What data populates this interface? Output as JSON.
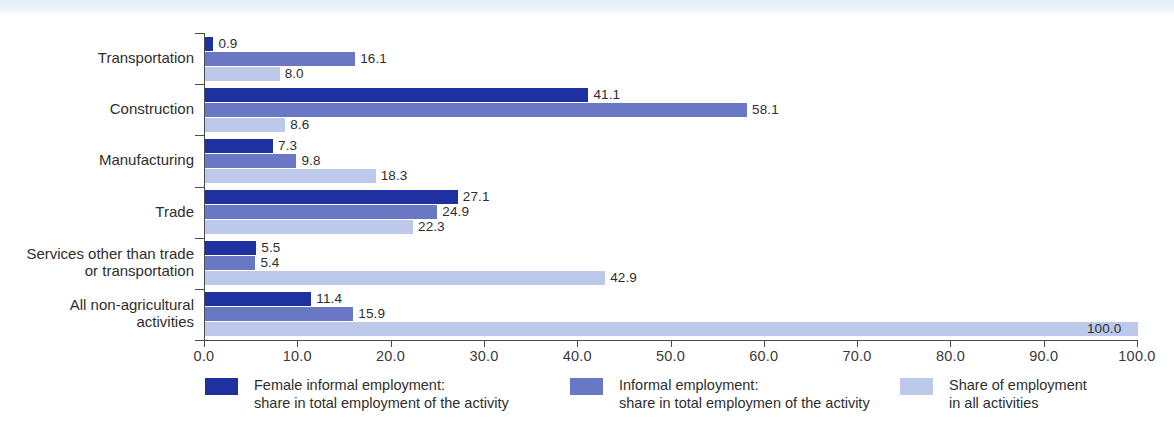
{
  "chart_data": {
    "type": "bar",
    "orientation": "horizontal",
    "title": "",
    "subtitle": "",
    "xlabel": "",
    "ylabel": "",
    "xlim": [
      0.0,
      100.0
    ],
    "xticks": [
      "0.0",
      "10.0",
      "20.0",
      "30.0",
      "40.0",
      "50.0",
      "60.0",
      "70.0",
      "80.0",
      "90.0",
      "100.0"
    ],
    "xtick_values": [
      0,
      10,
      20,
      30,
      40,
      50,
      60,
      70,
      80,
      90,
      100
    ],
    "grid": false,
    "legend_position": "bottom",
    "categories": [
      "Transportation",
      "Construction",
      "Manufacturing",
      "Trade",
      "Services other than trade\nor transportation",
      "All non-agricultural\nactivities"
    ],
    "series": [
      {
        "name": "Female informal employment:\nshare in total employment of the activity",
        "color": "#1f31a0",
        "values": [
          0.9,
          41.1,
          7.3,
          27.1,
          5.5,
          11.4
        ],
        "labels": [
          "0.9",
          "41.1",
          "7.3",
          "27.1",
          "5.5",
          "11.4"
        ]
      },
      {
        "name": "Informal employment:\nshare in total employmen of the activity",
        "color": "#6878c4",
        "values": [
          16.1,
          58.1,
          9.8,
          24.9,
          5.4,
          15.9
        ],
        "labels": [
          "16.1",
          "58.1",
          "9.8",
          "24.9",
          "5.4",
          "15.9"
        ]
      },
      {
        "name": "Share of employment\nin all activities",
        "color": "#bcc9ea",
        "values": [
          8.0,
          8.6,
          18.3,
          22.3,
          42.9,
          100.0
        ],
        "labels": [
          "8.0",
          "8.6",
          "18.3",
          "22.3",
          "42.9",
          "100.0"
        ]
      }
    ]
  },
  "legend": {
    "items": [
      {
        "label": "Female informal employment:\nshare in total employment of the activity",
        "color": "#1f31a0"
      },
      {
        "label": "Informal employment:\nshare in total employmen of the activity",
        "color": "#6878c4"
      },
      {
        "label": "Share of employment\nin all activities",
        "color": "#bcc9ea"
      }
    ]
  },
  "colors": {
    "series_dark": "#1f31a0",
    "series_medium": "#6878c4",
    "series_light": "#bcc9ea",
    "axis": "#4c4c4c",
    "text": "#2e2e2e",
    "top_band": "#e3eef8",
    "background": "#ffffff"
  }
}
